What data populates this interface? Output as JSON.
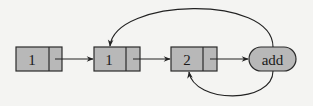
{
  "diagram": {
    "type": "linked-list",
    "nodes": [
      {
        "id": "n1",
        "value": "1",
        "kind": "list-cell"
      },
      {
        "id": "n2",
        "value": "1",
        "kind": "list-cell"
      },
      {
        "id": "n3",
        "value": "2",
        "kind": "list-cell"
      },
      {
        "id": "op",
        "value": "add",
        "kind": "operation"
      }
    ],
    "edges": [
      {
        "from": "n1",
        "to": "n2",
        "style": "straight"
      },
      {
        "from": "n2",
        "to": "n3",
        "style": "straight"
      },
      {
        "from": "n3",
        "to": "op",
        "style": "straight"
      },
      {
        "from": "op",
        "to": "n2",
        "style": "arc-over"
      },
      {
        "from": "op",
        "to": "n3",
        "style": "arc-under"
      }
    ],
    "colors": {
      "node_fill": "#b8b8b8",
      "stroke": "#2a2a2a",
      "background": "#f4f4f2"
    }
  }
}
